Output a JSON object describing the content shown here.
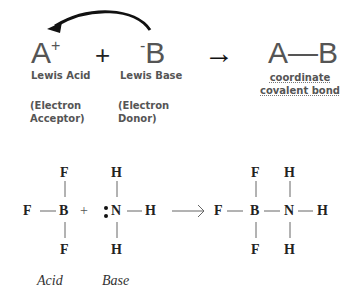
{
  "top_reaction": {
    "acid_symbol": "A",
    "acid_charge": "+",
    "plus": "+",
    "base_charge": "-",
    "base_symbol": "B",
    "product": "A—B",
    "reaction_arrow": "→",
    "acid_label": "Lewis Acid",
    "base_label": "Lewis Base",
    "acid_desc_line1": "(Electron",
    "acid_desc_line2": "Acceptor)",
    "base_desc_line1": "(Electron",
    "base_desc_line2": "Donor)",
    "product_label_line1": "coordinate",
    "product_label_line2": "covalent bond"
  },
  "bottom_reaction": {
    "bf3": {
      "center": "B",
      "top": "F",
      "left": "F",
      "bottom": "F"
    },
    "plus": "+",
    "nh3": {
      "center": "N",
      "top": "H",
      "right": "H",
      "bottom": "H",
      "lone_pair": ":"
    },
    "product": {
      "b": "B",
      "n": "N",
      "f_top": "F",
      "f_left": "F",
      "f_bottom": "F",
      "h_top": "H",
      "h_right": "H",
      "h_bottom": "H"
    },
    "acid_label": "Acid",
    "base_label": "Base"
  }
}
